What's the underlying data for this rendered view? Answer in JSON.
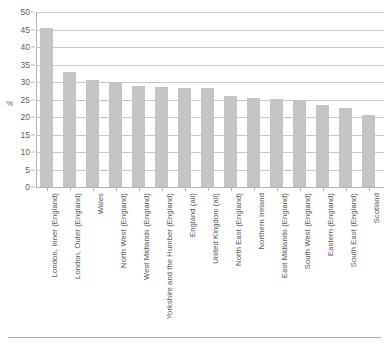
{
  "chart_data": {
    "type": "bar",
    "title": "",
    "xlabel": "",
    "ylabel": "%",
    "ylim": [
      0,
      50
    ],
    "yticks": [
      0,
      5,
      10,
      15,
      20,
      25,
      30,
      35,
      40,
      45,
      50
    ],
    "grid": true,
    "legend": "none",
    "bar_color": "#c4c4c4",
    "categories": [
      "London, Inner (England)",
      "London, Outer (England)",
      "Wales",
      "North West (England)",
      "West Midlands (England)",
      "Yorkshire and the Humber (England)",
      "England (all)",
      "United Kingdom (all)",
      "North East (England)",
      "Northern Ireland",
      "East Midlands (England)",
      "South West (England)",
      "Eastern (England)",
      "South East (England)",
      "Scotland"
    ],
    "values": [
      45.5,
      33.0,
      30.7,
      30.0,
      28.8,
      28.5,
      28.3,
      28.2,
      26.0,
      25.4,
      25.2,
      25.0,
      23.5,
      22.5,
      20.5
    ]
  }
}
